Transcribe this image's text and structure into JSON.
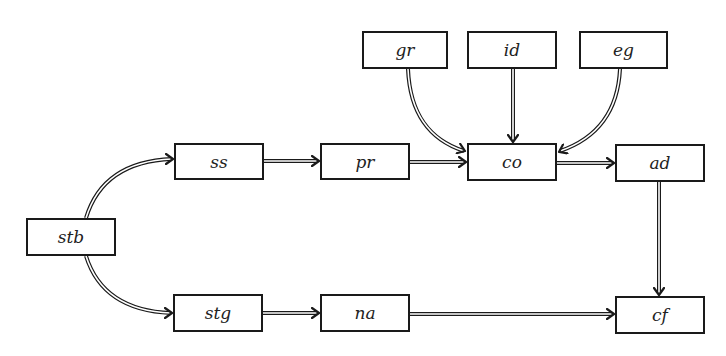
{
  "diagram": {
    "type": "flow",
    "nodes": [
      {
        "id": "stb",
        "label": "stb",
        "x": 26,
        "y": 218,
        "w": 90,
        "h": 38
      },
      {
        "id": "ss",
        "label": "ss",
        "x": 174,
        "y": 143,
        "w": 90,
        "h": 37
      },
      {
        "id": "pr",
        "label": "pr",
        "x": 320,
        "y": 143,
        "w": 90,
        "h": 37
      },
      {
        "id": "co",
        "label": "co",
        "x": 467,
        "y": 143,
        "w": 90,
        "h": 38
      },
      {
        "id": "ad",
        "label": "ad",
        "x": 615,
        "y": 144,
        "w": 90,
        "h": 38
      },
      {
        "id": "gr",
        "label": "gr",
        "x": 362,
        "y": 31,
        "w": 86,
        "h": 38
      },
      {
        "id": "id",
        "label": "id",
        "x": 467,
        "y": 31,
        "w": 90,
        "h": 38
      },
      {
        "id": "eg",
        "label": "eg",
        "x": 579,
        "y": 31,
        "w": 89,
        "h": 38
      },
      {
        "id": "stg",
        "label": "stg",
        "x": 173,
        "y": 294,
        "w": 90,
        "h": 38
      },
      {
        "id": "na",
        "label": "na",
        "x": 320,
        "y": 294,
        "w": 90,
        "h": 38
      },
      {
        "id": "cf",
        "label": "cf",
        "x": 615,
        "y": 296,
        "w": 90,
        "h": 38
      }
    ],
    "edges": [
      {
        "from": "stb",
        "to": "ss",
        "style": "double",
        "shape": "curve"
      },
      {
        "from": "stb",
        "to": "stg",
        "style": "double",
        "shape": "curve"
      },
      {
        "from": "ss",
        "to": "pr",
        "style": "double",
        "shape": "straight"
      },
      {
        "from": "pr",
        "to": "co",
        "style": "double",
        "shape": "straight"
      },
      {
        "from": "gr",
        "to": "co",
        "style": "double",
        "shape": "curve"
      },
      {
        "from": "id",
        "to": "co",
        "style": "double",
        "shape": "straight"
      },
      {
        "from": "eg",
        "to": "co",
        "style": "double",
        "shape": "curve"
      },
      {
        "from": "co",
        "to": "ad",
        "style": "double",
        "shape": "straight"
      },
      {
        "from": "ad",
        "to": "cf",
        "style": "double",
        "shape": "straight"
      },
      {
        "from": "stg",
        "to": "na",
        "style": "double",
        "shape": "straight"
      },
      {
        "from": "na",
        "to": "cf",
        "style": "double",
        "shape": "straight"
      }
    ]
  },
  "colors": {
    "stroke": "#1a1a1a",
    "background": "#ffffff",
    "text": "#222222"
  }
}
